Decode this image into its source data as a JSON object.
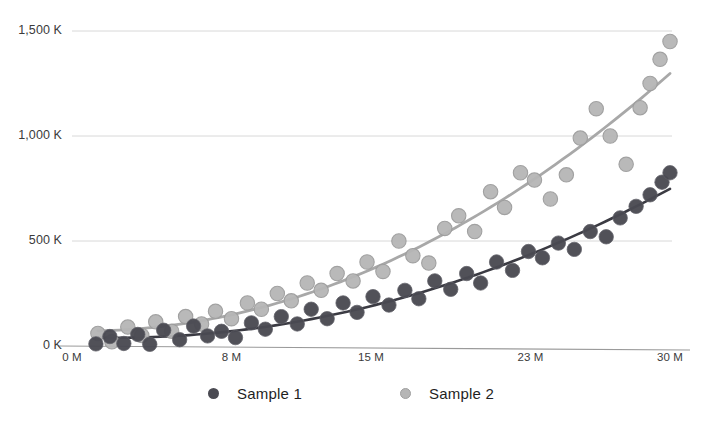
{
  "chart_data": {
    "type": "scatter",
    "title": "",
    "subtitle": "",
    "xlabel": "",
    "ylabel": "",
    "xlim": [
      0,
      30
    ],
    "ylim": [
      0,
      1500
    ],
    "x_unit": "M",
    "y_unit": "K",
    "grid": "horizontal",
    "legend_position": "bottom-center",
    "x_tick_labels": [
      "0 M",
      "8 M",
      "15 M",
      "23 M",
      "30 M"
    ],
    "x_tick_values": [
      0,
      8,
      15,
      23,
      30
    ],
    "y_tick_labels": [
      "0 K",
      "500 K",
      "1,000 K",
      "1,500 K"
    ],
    "y_tick_values": [
      0,
      500,
      1000,
      1500
    ],
    "colors": {
      "sample_1": "#4a4a52",
      "sample_2": "#b6b6b6",
      "sample_1_line": "#3b3b43",
      "sample_2_line": "#a8a8a8",
      "grid": "#d8d8d8",
      "axis": "#9a9a9a",
      "text": "#3b3b3b"
    },
    "series": [
      {
        "name": "Sample 1",
        "color": "#4a4a52",
        "marker": "filled-circle",
        "trendline": "quadratic",
        "points": [
          [
            1.2,
            10
          ],
          [
            1.9,
            45
          ],
          [
            2.6,
            12
          ],
          [
            3.3,
            55
          ],
          [
            3.9,
            8
          ],
          [
            4.6,
            75
          ],
          [
            5.4,
            30
          ],
          [
            6.1,
            95
          ],
          [
            6.8,
            48
          ],
          [
            7.5,
            70
          ],
          [
            8.2,
            40
          ],
          [
            9.0,
            110
          ],
          [
            9.7,
            80
          ],
          [
            10.5,
            140
          ],
          [
            11.3,
            105
          ],
          [
            12.0,
            175
          ],
          [
            12.8,
            130
          ],
          [
            13.6,
            205
          ],
          [
            14.3,
            160
          ],
          [
            15.1,
            235
          ],
          [
            15.9,
            195
          ],
          [
            16.7,
            265
          ],
          [
            17.4,
            225
          ],
          [
            18.2,
            310
          ],
          [
            19.0,
            270
          ],
          [
            19.8,
            345
          ],
          [
            20.5,
            300
          ],
          [
            21.3,
            400
          ],
          [
            22.1,
            360
          ],
          [
            22.9,
            450
          ],
          [
            23.6,
            420
          ],
          [
            24.4,
            490
          ],
          [
            25.2,
            460
          ],
          [
            26.0,
            545
          ],
          [
            26.8,
            520
          ],
          [
            27.5,
            610
          ],
          [
            28.3,
            665
          ],
          [
            29.0,
            720
          ],
          [
            29.6,
            780
          ],
          [
            30.0,
            825
          ]
        ]
      },
      {
        "name": "Sample 2",
        "color": "#b6b6b6",
        "marker": "open-circle",
        "trendline": "quadratic",
        "points": [
          [
            1.3,
            60
          ],
          [
            2.0,
            20
          ],
          [
            2.8,
            90
          ],
          [
            3.5,
            50
          ],
          [
            4.2,
            115
          ],
          [
            5.0,
            70
          ],
          [
            5.7,
            140
          ],
          [
            6.5,
            105
          ],
          [
            7.2,
            165
          ],
          [
            8.0,
            130
          ],
          [
            8.8,
            205
          ],
          [
            9.5,
            175
          ],
          [
            10.3,
            250
          ],
          [
            11.0,
            215
          ],
          [
            11.8,
            300
          ],
          [
            12.5,
            265
          ],
          [
            13.3,
            345
          ],
          [
            14.1,
            310
          ],
          [
            14.8,
            400
          ],
          [
            15.6,
            355
          ],
          [
            16.4,
            500
          ],
          [
            17.1,
            430
          ],
          [
            17.9,
            395
          ],
          [
            18.7,
            560
          ],
          [
            19.4,
            620
          ],
          [
            20.2,
            545
          ],
          [
            21.0,
            735
          ],
          [
            21.7,
            660
          ],
          [
            22.5,
            825
          ],
          [
            23.2,
            790
          ],
          [
            24.0,
            700
          ],
          [
            24.8,
            815
          ],
          [
            25.5,
            990
          ],
          [
            26.3,
            1130
          ],
          [
            27.0,
            1000
          ],
          [
            27.8,
            865
          ],
          [
            28.5,
            1135
          ],
          [
            29.0,
            1250
          ],
          [
            29.5,
            1365
          ],
          [
            30.0,
            1450
          ]
        ]
      }
    ]
  },
  "legend": {
    "items": [
      {
        "label": "Sample 1",
        "color": "#4a4a52"
      },
      {
        "label": "Sample 2",
        "color": "#b6b6b6"
      }
    ]
  }
}
